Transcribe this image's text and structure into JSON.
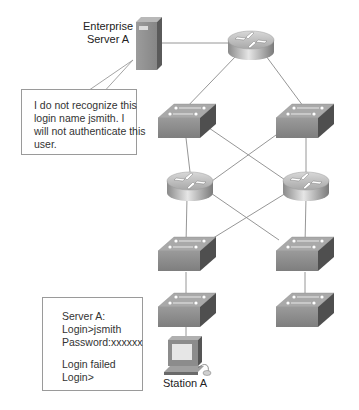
{
  "diagram": {
    "server": {
      "label_line1": "Enterprise",
      "label_line2": "Server A",
      "icon": "server-tower-icon"
    },
    "station": {
      "label": "Station A",
      "icon": "workstation-icon"
    },
    "callout": {
      "lines": [
        "I do not recognize this",
        "login name jsmith. I",
        "will not authenticate this",
        "user."
      ]
    },
    "terminal": {
      "lines": [
        "Server A:",
        "Login>jsmith",
        "Password:xxxxxx",
        "",
        "Login failed",
        "Login>"
      ]
    },
    "devices": {
      "routers": [
        "top-router",
        "left-router",
        "right-router"
      ],
      "switches": [
        "left-switch-1",
        "right-switch-1",
        "left-switch-2",
        "right-switch-2",
        "left-switch-3",
        "right-switch-3"
      ]
    },
    "colors": {
      "line": "#8a8a8a",
      "device_gray": "#8f8f8f",
      "device_dark": "#5e5e5e",
      "box_border": "#9a9a9a"
    }
  }
}
